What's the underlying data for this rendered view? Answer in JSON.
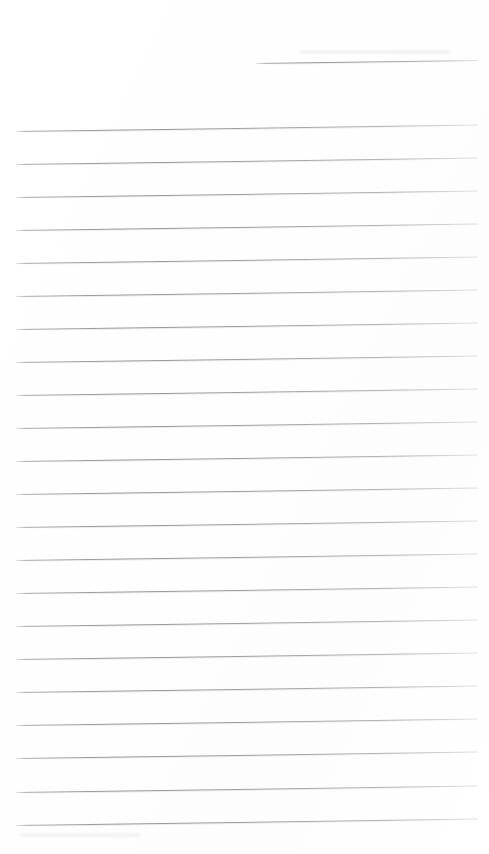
{
  "document": {
    "kind": "scanned-lined-paper",
    "title": "Blank ruled notebook page",
    "page_width": 489,
    "page_height": 854,
    "background_color": "#ffffff",
    "rule_color": "#8a8a91",
    "rule_thickness_px": 1,
    "is_blank": true,
    "handwriting_present": false,
    "typed_text_present": false,
    "visible_text": "",
    "margin": {
      "left_px": 16,
      "right_px": 478,
      "top_blank_px": 55,
      "bottom_blank_px": 29
    },
    "skew": {
      "description": "page scanned slightly rotated; right edge of each rule is higher than the left",
      "rise_px_across_page": 6.5,
      "angle_deg": -0.8
    },
    "ruling": {
      "total_rules": 23,
      "full_width_rules": 22,
      "partial_rules": 1,
      "average_spacing_px": 33,
      "first_full_rule_y": 131,
      "last_full_rule_y": 825
    },
    "rules": [
      {
        "id": "rule-header",
        "index": 0,
        "x_start": 256,
        "x_end": 478,
        "y_left": 63,
        "width_px": 222,
        "span": "partial",
        "note": "short header rule, right half of page only"
      },
      {
        "id": "rule-01",
        "index": 1,
        "x_start": 16,
        "x_end": 478,
        "y_left": 131,
        "width_px": 462,
        "span": "full"
      },
      {
        "id": "rule-02",
        "index": 2,
        "x_start": 16,
        "x_end": 478,
        "y_left": 164,
        "width_px": 462,
        "span": "full"
      },
      {
        "id": "rule-03",
        "index": 3,
        "x_start": 16,
        "x_end": 478,
        "y_left": 197,
        "width_px": 462,
        "span": "full"
      },
      {
        "id": "rule-04",
        "index": 4,
        "x_start": 16,
        "x_end": 478,
        "y_left": 230,
        "width_px": 462,
        "span": "full"
      },
      {
        "id": "rule-05",
        "index": 5,
        "x_start": 16,
        "x_end": 478,
        "y_left": 263,
        "width_px": 462,
        "span": "full"
      },
      {
        "id": "rule-06",
        "index": 6,
        "x_start": 16,
        "x_end": 478,
        "y_left": 296,
        "width_px": 462,
        "span": "full"
      },
      {
        "id": "rule-07",
        "index": 7,
        "x_start": 16,
        "x_end": 478,
        "y_left": 329,
        "width_px": 462,
        "span": "full"
      },
      {
        "id": "rule-08",
        "index": 8,
        "x_start": 16,
        "x_end": 478,
        "y_left": 362,
        "width_px": 462,
        "span": "full"
      },
      {
        "id": "rule-09",
        "index": 9,
        "x_start": 16,
        "x_end": 478,
        "y_left": 395,
        "width_px": 462,
        "span": "full"
      },
      {
        "id": "rule-10",
        "index": 10,
        "x_start": 16,
        "x_end": 478,
        "y_left": 428,
        "width_px": 462,
        "span": "full"
      },
      {
        "id": "rule-11",
        "index": 11,
        "x_start": 16,
        "x_end": 478,
        "y_left": 461,
        "width_px": 462,
        "span": "full"
      },
      {
        "id": "rule-12",
        "index": 12,
        "x_start": 16,
        "x_end": 478,
        "y_left": 494,
        "width_px": 462,
        "span": "full"
      },
      {
        "id": "rule-13",
        "index": 13,
        "x_start": 16,
        "x_end": 478,
        "y_left": 527,
        "width_px": 462,
        "span": "full"
      },
      {
        "id": "rule-14",
        "index": 14,
        "x_start": 16,
        "x_end": 478,
        "y_left": 560,
        "width_px": 462,
        "span": "full"
      },
      {
        "id": "rule-15",
        "index": 15,
        "x_start": 16,
        "x_end": 478,
        "y_left": 593,
        "width_px": 462,
        "span": "full"
      },
      {
        "id": "rule-16",
        "index": 16,
        "x_start": 16,
        "x_end": 478,
        "y_left": 626,
        "width_px": 462,
        "span": "full"
      },
      {
        "id": "rule-17",
        "index": 17,
        "x_start": 16,
        "x_end": 478,
        "y_left": 659,
        "width_px": 462,
        "span": "full"
      },
      {
        "id": "rule-18",
        "index": 18,
        "x_start": 16,
        "x_end": 478,
        "y_left": 692,
        "width_px": 462,
        "span": "full"
      },
      {
        "id": "rule-19",
        "index": 19,
        "x_start": 16,
        "x_end": 478,
        "y_left": 725,
        "width_px": 462,
        "span": "full"
      },
      {
        "id": "rule-20",
        "index": 20,
        "x_start": 16,
        "x_end": 478,
        "y_left": 758,
        "width_px": 462,
        "span": "full"
      },
      {
        "id": "rule-21",
        "index": 21,
        "x_start": 16,
        "x_end": 478,
        "y_left": 792,
        "width_px": 462,
        "span": "full"
      },
      {
        "id": "rule-22",
        "index": 22,
        "x_start": 16,
        "x_end": 478,
        "y_left": 825,
        "width_px": 462,
        "span": "full"
      }
    ],
    "artifacts": [
      {
        "id": "smudge-top-right",
        "x": 300,
        "y": 50,
        "width": 150,
        "height": 4
      },
      {
        "id": "smudge-bottom-left",
        "x": 20,
        "y": 833,
        "width": 120,
        "height": 4
      }
    ]
  }
}
